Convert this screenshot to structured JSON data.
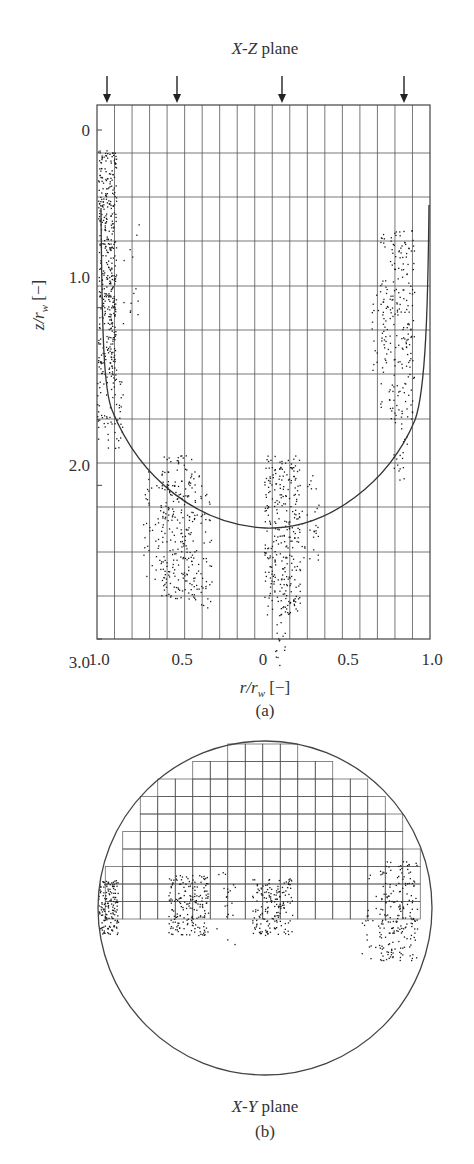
{
  "panel_a": {
    "title": "X-Z plane",
    "title_italic": "X-Z",
    "title_rest": " plane",
    "caption": "(a)",
    "xlabel_var": "r/r",
    "xlabel_sub": "w",
    "xlabel_unit": " [−]",
    "ylabel_var": "z/r",
    "ylabel_sub": "w",
    "ylabel_unit": " [−]",
    "x_ticks": [
      "1.0",
      "0.5",
      "0",
      "0.5",
      "1.0"
    ],
    "y_ticks": [
      "0",
      "1.0",
      "2.0",
      "3.0"
    ],
    "arrow_count": 4,
    "grid_columns": 19,
    "grid_rows": 12
  },
  "panel_b": {
    "title_italic": "X-Y",
    "title_rest": " plane",
    "caption": "(b)"
  },
  "colors": {
    "ink": "#333333",
    "grid": "#555555",
    "dots": "#1a1a1a",
    "background": "#ffffff"
  },
  "chart_data": [
    {
      "type": "scatter",
      "title": "X-Z plane",
      "xlabel": "r/r_w [−]",
      "ylabel": "z/r_w [−]",
      "x_tick_labels": [
        "1.0",
        "0.5",
        "0",
        "0.5",
        "1.0"
      ],
      "y_tick_labels": [
        "0",
        "1.0",
        "2.0",
        "3.0"
      ],
      "ylim": [
        0,
        3.0
      ],
      "y_inverted": true,
      "grid": true,
      "annotations": [
        "4 downward arrows marking injection positions at r/r_w ≈ 0.95 (left), 0.55 (left), 0.1 (right), 0.85 (right)"
      ],
      "curve": {
        "description": "U-shaped interface curve from top-left wall down to z/r_w ≈ 2.3 at center and back up to right wall near z/r_w ≈ 0.3"
      },
      "particle_clusters": [
        {
          "x_side": "left",
          "r": 0.95,
          "z_range": [
            0.2,
            1.9
          ]
        },
        {
          "x_side": "left",
          "r": 0.5,
          "z_range": [
            1.6,
            2.8
          ]
        },
        {
          "x_side": "right",
          "r": 0.1,
          "z_range": [
            1.6,
            3.0
          ]
        },
        {
          "x_side": "right",
          "r": 0.85,
          "z_range": [
            0.9,
            2.5
          ]
        }
      ]
    },
    {
      "type": "scatter",
      "title": "X-Y plane",
      "grid": true,
      "shape": "circle",
      "particle_clusters": [
        {
          "x": -0.95,
          "y": 0
        },
        {
          "x": -0.5,
          "y": 0
        },
        {
          "x": 0.1,
          "y": 0
        },
        {
          "x": 0.85,
          "y": 0
        }
      ]
    }
  ]
}
